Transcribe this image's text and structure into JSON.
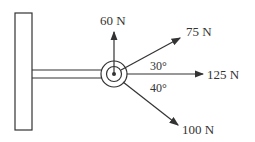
{
  "diagram": {
    "forces": [
      {
        "label": "60 N",
        "direction": "up"
      },
      {
        "label": "75 N",
        "angle_deg": 30
      },
      {
        "label": "125 N",
        "angle_deg": 0
      },
      {
        "label": "100 N",
        "angle_deg": -40
      }
    ],
    "angles": [
      {
        "label": "30°"
      },
      {
        "label": "40°"
      }
    ],
    "colors": {
      "line": "#333333",
      "background": "#ffffff"
    }
  }
}
